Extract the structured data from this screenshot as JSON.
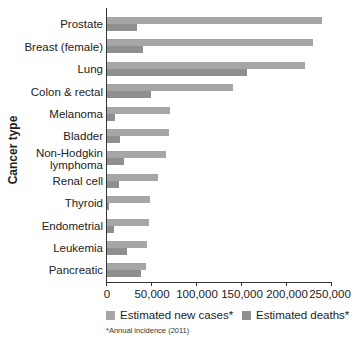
{
  "chart_data": {
    "type": "bar",
    "orientation": "horizontal",
    "title": "",
    "xlabel": "",
    "ylabel": "Cancer type",
    "xlim": [
      0,
      250000
    ],
    "x_ticks": [
      "0",
      "50,000",
      "100,000",
      "150,000",
      "200,000",
      "250,000"
    ],
    "grid": false,
    "legend_position": "bottom",
    "categories": [
      "Prostate",
      "Breast (female)",
      "Lung",
      "Colon & rectal",
      "Melanoma",
      "Bladder",
      "Non-Hodgkin lymphoma",
      "Renal cell",
      "Thyroid",
      "Endometrial",
      "Leukemia",
      "Pancreatic"
    ],
    "series": [
      {
        "name": "Estimated new cases*",
        "color": "#a6a6a6",
        "values": [
          240000,
          230000,
          221000,
          141000,
          70000,
          69000,
          66000,
          57000,
          48000,
          47000,
          45000,
          44000
        ]
      },
      {
        "name": "Estimated deaths*",
        "color": "#8f8f8f",
        "values": [
          33000,
          40000,
          156000,
          49000,
          9000,
          15000,
          19000,
          13000,
          1700,
          8000,
          22000,
          38000
        ]
      }
    ],
    "footnote": "*Annual incidence (2011)"
  },
  "labels": {
    "ylabel": "Cancer type",
    "cats": [
      "Prostate",
      "Breast (female)",
      "Lung",
      "Colon & rectal",
      "Melanoma",
      "Bladder",
      "Non-Hodgkin",
      "lymphoma",
      "Renal cell",
      "Thyroid",
      "Endometrial",
      "Leukemia",
      "Pancreatic"
    ],
    "ticks": [
      "0",
      "50,000",
      "100,000",
      "150,000",
      "200,000",
      "250,000"
    ],
    "legend_new": "Estimated new cases*",
    "legend_deaths": "Estimated deaths*",
    "footnote": "*Annual incidence (2011)"
  }
}
